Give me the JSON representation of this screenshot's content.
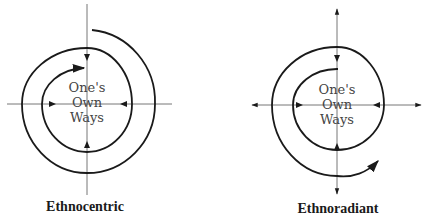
{
  "diagrams": [
    {
      "name": "ethnocentric",
      "caption": "Ethnocentric",
      "center_text": [
        "One's",
        "Own",
        "Ways"
      ],
      "spiral_direction": "inward",
      "axis_arrows": "inward"
    },
    {
      "name": "ethnoradiant",
      "caption": "Ethnoradiant",
      "center_text": [
        "One's",
        "Own",
        "Ways"
      ],
      "spiral_direction": "outward",
      "axis_arrows": "bidirectional"
    }
  ],
  "colors": {
    "stroke": "#1a1a1a",
    "axis": "#555555",
    "text": "#444444"
  }
}
